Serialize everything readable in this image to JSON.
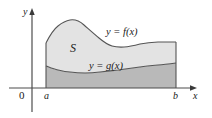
{
  "figure": {
    "background_color": "#ffffff",
    "axes": {
      "x_axis_label": "x",
      "y_axis_label": "y",
      "origin_label": "0",
      "axis_color": "#4d4d4d",
      "x_axis_y": 88,
      "y_axis_x": 32
    },
    "bounds": {
      "lower_limit_label": "a",
      "upper_limit_label": "b",
      "lower_limit_x": 46,
      "upper_limit_x": 176
    },
    "region": {
      "label": "S",
      "fill_color": "#e3e3e3",
      "lower_fill_color": "#b9b9b9",
      "outline_color": "#555555"
    },
    "curves": [
      {
        "name": "upper-curve",
        "label": "y = f(x)",
        "points": [
          [
            46,
            43
          ],
          [
            58,
            26
          ],
          [
            70,
            20
          ],
          [
            84,
            25
          ],
          [
            99,
            38
          ],
          [
            112,
            46
          ],
          [
            124,
            47
          ],
          [
            140,
            44
          ],
          [
            158,
            42
          ],
          [
            176,
            42
          ]
        ]
      },
      {
        "name": "lower-curve",
        "label": "y = g(x)",
        "points": [
          [
            46,
            66
          ],
          [
            58,
            70
          ],
          [
            70,
            72
          ],
          [
            85,
            73
          ],
          [
            100,
            72
          ],
          [
            118,
            70
          ],
          [
            140,
            67
          ],
          [
            158,
            65
          ],
          [
            176,
            63
          ]
        ]
      }
    ]
  }
}
